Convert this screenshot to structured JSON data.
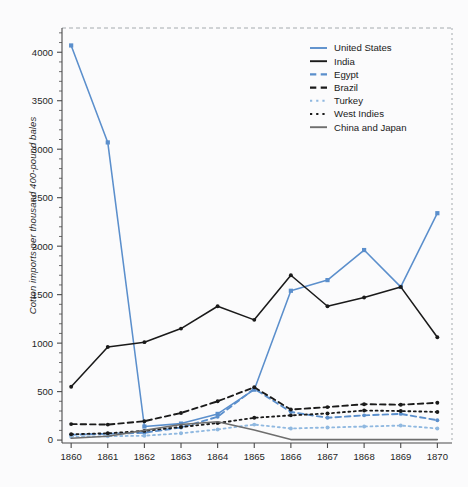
{
  "chart_data": {
    "type": "line",
    "title": "",
    "xlabel": "",
    "ylabel": "Cotton imports per thousand 400-pound bales",
    "x": [
      1860,
      1861,
      1862,
      1863,
      1864,
      1865,
      1866,
      1867,
      1868,
      1869,
      1870
    ],
    "xtick_labels": [
      "1860",
      "1861",
      "1862",
      "1863",
      "1864",
      "1865",
      "1866",
      "1867",
      "1868",
      "1869",
      "1870"
    ],
    "ytick_labels": [
      "0",
      "500",
      "1000",
      "1500",
      "2000",
      "2500",
      "3000",
      "3500",
      "4000"
    ],
    "yticks": [
      0,
      500,
      1000,
      1500,
      2000,
      2500,
      3000,
      3500,
      4000
    ],
    "xlim": [
      1859.75,
      1870.4
    ],
    "ylim": [
      -30,
      4250
    ],
    "grid": false,
    "legend_position": "top-right",
    "series": [
      {
        "name": "United States",
        "color": "#5b8fcc",
        "style": "solid",
        "marker": "square",
        "values": [
          4070,
          3070,
          140,
          170,
          270,
          520,
          1540,
          1650,
          1960,
          1580,
          2340
        ]
      },
      {
        "name": "India",
        "color": "#1a1a1a",
        "style": "solid",
        "marker": "dot",
        "values": [
          550,
          960,
          1010,
          1150,
          1380,
          1240,
          1700,
          1380,
          1470,
          1580,
          1060
        ]
      },
      {
        "name": "Egypt",
        "color": "#5b8fcc",
        "style": "dashed",
        "marker": "dot",
        "values": [
          55,
          65,
          75,
          130,
          240,
          530,
          290,
          230,
          255,
          270,
          205
        ]
      },
      {
        "name": "Brazil",
        "color": "#1a1a1a",
        "style": "dashed",
        "marker": "dot",
        "values": [
          165,
          160,
          195,
          280,
          400,
          545,
          315,
          340,
          370,
          365,
          385
        ]
      },
      {
        "name": "Turkey",
        "color": "#8fb8e0",
        "style": "dotted",
        "marker": "dot",
        "values": [
          35,
          40,
          45,
          70,
          110,
          160,
          120,
          130,
          140,
          150,
          120
        ]
      },
      {
        "name": "West Indies",
        "color": "#1a1a1a",
        "style": "dotted",
        "marker": "dot",
        "values": [
          60,
          70,
          95,
          135,
          175,
          230,
          255,
          275,
          305,
          300,
          290
        ]
      },
      {
        "name": "China and Japan",
        "color": "#6e6e6e",
        "style": "solid",
        "marker": "none",
        "values": [
          20,
          40,
          100,
          160,
          190,
          105,
          5,
          5,
          5,
          5,
          5
        ]
      }
    ]
  },
  "legend": {
    "items": [
      {
        "label": "United States"
      },
      {
        "label": "India"
      },
      {
        "label": "Egypt"
      },
      {
        "label": "Brazil"
      },
      {
        "label": "Turkey"
      },
      {
        "label": "West Indies"
      },
      {
        "label": "China and Japan"
      }
    ]
  }
}
